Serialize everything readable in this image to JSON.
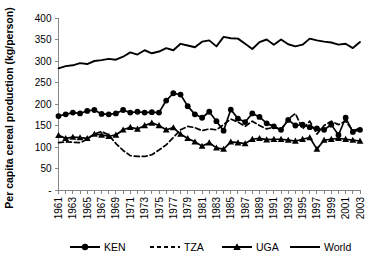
{
  "chart_data": {
    "type": "line",
    "title": "",
    "xlabel": "",
    "ylabel": "Per capita cereal production (kg/person)",
    "ylim": [
      0,
      400
    ],
    "ytick_values": [
      0,
      50,
      100,
      150,
      200,
      250,
      300,
      350,
      400
    ],
    "ytick_labels": [
      "-",
      "50",
      "100",
      "150",
      "200",
      "250",
      "300",
      "350",
      "400"
    ],
    "grid": false,
    "legend_position": "bottom",
    "x": [
      1961,
      1962,
      1963,
      1964,
      1965,
      1966,
      1967,
      1968,
      1969,
      1970,
      1971,
      1972,
      1973,
      1974,
      1975,
      1976,
      1977,
      1978,
      1979,
      1980,
      1981,
      1982,
      1983,
      1984,
      1985,
      1986,
      1987,
      1988,
      1989,
      1990,
      1991,
      1992,
      1993,
      1994,
      1995,
      1996,
      1997,
      1998,
      1999,
      2000,
      2001,
      2002,
      2003
    ],
    "xtick_labels": [
      "1961",
      "",
      "1963",
      "",
      "1965",
      "",
      "1967",
      "",
      "1969",
      "",
      "1971",
      "",
      "1973",
      "",
      "1975",
      "",
      "1977",
      "",
      "1979",
      "",
      "1981",
      "",
      "1983",
      "",
      "1985",
      "",
      "1987",
      "",
      "1989",
      "",
      "1991",
      "",
      "1993",
      "",
      "1995",
      "",
      "1997",
      "",
      "1999",
      "",
      "2001",
      "",
      "2003"
    ],
    "series": [
      {
        "name": "KEN",
        "marker": "circle",
        "dash": "solid",
        "values": [
          172,
          176,
          180,
          178,
          184,
          186,
          177,
          176,
          178,
          186,
          180,
          182,
          180,
          181,
          180,
          208,
          225,
          222,
          195,
          176,
          168,
          182,
          160,
          138,
          187,
          166,
          158,
          178,
          170,
          155,
          148,
          140,
          163,
          150,
          152,
          146,
          143,
          140,
          152,
          128,
          168,
          135,
          140
        ]
      },
      {
        "name": "TZA",
        "marker": "none",
        "dash": "dashed",
        "values": [
          110,
          112,
          111,
          110,
          118,
          130,
          136,
          128,
          108,
          92,
          80,
          78,
          78,
          82,
          93,
          105,
          122,
          140,
          148,
          145,
          138,
          142,
          140,
          152,
          165,
          158,
          148,
          160,
          150,
          142,
          146,
          140,
          165,
          178,
          142,
          160,
          130,
          150,
          160,
          152,
          160,
          138,
          143
        ]
      },
      {
        "name": "UGA",
        "marker": "triangle",
        "dash": "solid",
        "values": [
          127,
          120,
          123,
          122,
          120,
          130,
          128,
          125,
          128,
          140,
          146,
          142,
          150,
          156,
          150,
          140,
          145,
          130,
          120,
          112,
          102,
          110,
          98,
          95,
          112,
          110,
          108,
          118,
          120,
          117,
          118,
          118,
          116,
          114,
          118,
          122,
          95,
          116,
          118,
          120,
          118,
          116,
          114
        ]
      },
      {
        "name": "World",
        "marker": "none",
        "dash": "solid",
        "values": [
          283,
          288,
          290,
          295,
          293,
          300,
          302,
          305,
          303,
          310,
          320,
          315,
          325,
          318,
          322,
          330,
          325,
          340,
          336,
          332,
          345,
          348,
          334,
          356,
          353,
          352,
          340,
          328,
          344,
          350,
          338,
          350,
          339,
          334,
          338,
          352,
          348,
          345,
          343,
          338,
          340,
          330,
          344
        ]
      }
    ]
  },
  "legend": {
    "items": [
      {
        "label": "KEN"
      },
      {
        "label": "TZA"
      },
      {
        "label": "UGA"
      },
      {
        "label": "World"
      }
    ]
  }
}
